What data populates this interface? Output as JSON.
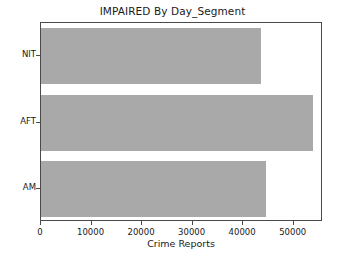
{
  "chart_data": {
    "type": "bar",
    "orientation": "horizontal",
    "title": "IMPAIRED By Day_Segment",
    "xlabel": "Crime Reports",
    "ylabel": "",
    "categories": [
      "AM",
      "AFT",
      "NIT"
    ],
    "values": [
      44500,
      53900,
      43500
    ],
    "xlim": [
      0,
      55800
    ],
    "ylim": [
      -0.5,
      2.5
    ],
    "xticks": [
      0,
      10000,
      20000,
      30000,
      40000,
      50000
    ],
    "xticklabels": [
      "0",
      "10000",
      "20000",
      "30000",
      "40000",
      "50000"
    ],
    "yticklabels": [
      "AM",
      "AFT",
      "NIT"
    ],
    "grid": false,
    "legend": null,
    "bar_color": "#a9a9a9",
    "frame_color": "#4a4a4a",
    "background_color": "#ffffff"
  }
}
